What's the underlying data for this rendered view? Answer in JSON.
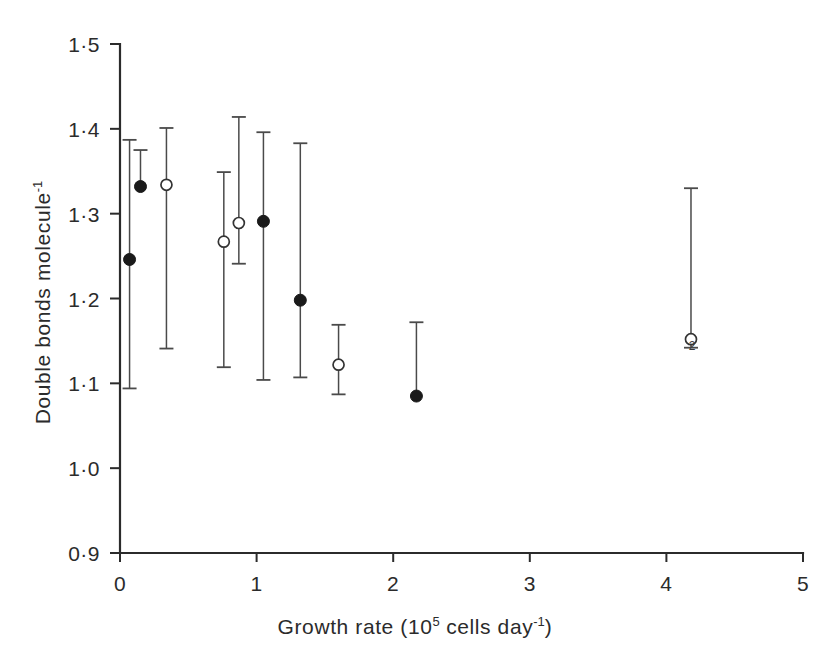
{
  "figure": {
    "background_color": "#ffffff",
    "ink_color": "#2b2b2b"
  },
  "axes": {
    "y_title_main": "Double bonds molecule",
    "y_title_exponent": "-1",
    "x_title_prefix": "Growth rate (10",
    "x_title_exponent": "5",
    "x_title_mid": " cells day",
    "x_title_exponent2": "-1",
    "x_title_suffix": ")"
  },
  "chart_data": {
    "type": "scatter",
    "title": "",
    "xlabel": "Growth rate (10^5 cells day^-1)",
    "ylabel": "Double bonds molecule^-1",
    "xlim": [
      0,
      5
    ],
    "ylim": [
      0.9,
      1.5
    ],
    "grid": false,
    "legend": "none",
    "x_ticks": [
      0,
      1,
      2,
      3,
      4,
      5
    ],
    "x_tick_labels": [
      "0",
      "1",
      "2",
      "3",
      "4",
      "5"
    ],
    "y_ticks": [
      0.9,
      1.0,
      1.1,
      1.2,
      1.3,
      1.4,
      1.5
    ],
    "y_tick_labels": [
      "0·9",
      "1·0",
      "1·1",
      "1·2",
      "1·3",
      "1·4",
      "1·5"
    ],
    "marker_styles": {
      "filled": "closed circle",
      "open": "open circle"
    },
    "series": [
      {
        "name": "filled circles",
        "marker": "filled",
        "points": [
          {
            "x": 0.07,
            "y": 1.246,
            "err_low": 1.094,
            "err_high": 1.387,
            "label": ""
          },
          {
            "x": 0.15,
            "y": 1.332,
            "err_low": 1.332,
            "err_high": 1.375,
            "label": ""
          },
          {
            "x": 1.05,
            "y": 1.291,
            "err_low": 1.104,
            "err_high": 1.396,
            "label": ""
          },
          {
            "x": 1.32,
            "y": 1.198,
            "err_low": 1.107,
            "err_high": 1.383,
            "label": ""
          },
          {
            "x": 2.17,
            "y": 1.085,
            "err_low": 1.085,
            "err_high": 1.172,
            "label": ""
          }
        ]
      },
      {
        "name": "open circles",
        "marker": "open",
        "points": [
          {
            "x": 0.34,
            "y": 1.334,
            "err_low": 1.141,
            "err_high": 1.401,
            "label": ""
          },
          {
            "x": 0.76,
            "y": 1.267,
            "err_low": 1.119,
            "err_high": 1.349,
            "label": ""
          },
          {
            "x": 0.87,
            "y": 1.289,
            "err_low": 1.241,
            "err_high": 1.414,
            "label": ""
          },
          {
            "x": 1.6,
            "y": 1.122,
            "err_low": 1.087,
            "err_high": 1.169,
            "label": ""
          },
          {
            "x": 4.18,
            "y": 1.152,
            "err_low": 1.142,
            "err_high": 1.33,
            "label": "2"
          }
        ]
      }
    ]
  }
}
